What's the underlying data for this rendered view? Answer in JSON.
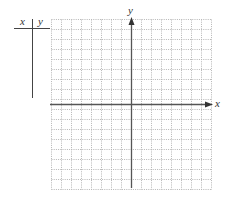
{
  "table": {
    "headers": [
      "x",
      "y"
    ],
    "rows": []
  },
  "graph": {
    "x_axis_label": "x",
    "y_axis_label": "y",
    "grid": {
      "columns": 16,
      "rows": 17,
      "cell_px": 10,
      "line_style": "dotted",
      "line_color": "#b5b5b5"
    },
    "axis_color": "#555555"
  }
}
